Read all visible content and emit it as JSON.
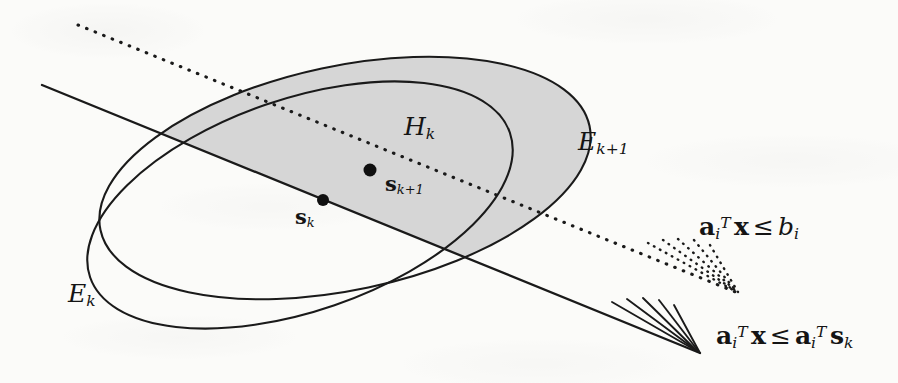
{
  "figure": {
    "kind": "geometric-diagram",
    "background_color": "#fbfbf9",
    "ink_color": "#1a1a1a",
    "shade_color": "#d4d4d4"
  },
  "labels": {
    "ellipsoid_current": {
      "base": "E",
      "sub": "k"
    },
    "ellipsoid_next": {
      "base": "E",
      "sub": "k+1"
    },
    "halfspace": {
      "base": "H",
      "sub": "k"
    },
    "center_current": {
      "base": "s",
      "sub": "k"
    },
    "center_next": {
      "base": "s",
      "sub": "k+1"
    }
  },
  "constraints": [
    {
      "id": "deep-cut",
      "lhs_vec": "a",
      "lhs_sub": "i",
      "lhs_sup": "T",
      "lhs_var": "x",
      "relation": "≤",
      "rhs": "b",
      "rhs_sub": "i",
      "line_style": "dotted"
    },
    {
      "id": "central-cut",
      "lhs_vec": "a",
      "lhs_sub": "i",
      "lhs_sup": "T",
      "lhs_var": "x",
      "relation": "≤",
      "rhs_vec": "a",
      "rhs_sub": "i",
      "rhs_sup": "T",
      "rhs_var": "s",
      "rhs_var_sub": "k",
      "line_style": "solid"
    }
  ],
  "geometry": {
    "ellipse_current": {
      "cx": 300,
      "cy": 205,
      "rx": 222,
      "ry": 106,
      "rotation_deg": -19
    },
    "ellipse_next": {
      "cx": 345,
      "cy": 178,
      "rx": 250,
      "ry": 112,
      "rotation_deg": -12
    },
    "cut_line_solid": {
      "x1": 42,
      "y1": 85,
      "x2": 700,
      "y2": 353
    },
    "cut_line_dotted": {
      "x1": 78,
      "y1": 25,
      "x2": 738,
      "y2": 293
    },
    "point_center_current": {
      "cx": 323,
      "cy": 200,
      "r": 6
    },
    "point_center_next": {
      "cx": 370,
      "cy": 170,
      "r": 6.5
    },
    "hatch_solid_count": 5,
    "hatch_dotted_count": 5
  }
}
